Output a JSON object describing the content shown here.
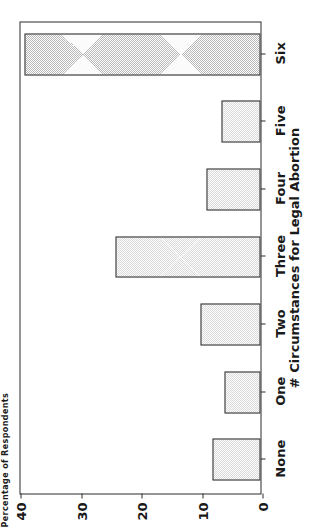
{
  "chart_data": {
    "type": "bar",
    "title": "",
    "xlabel": "# Circumstances for Legal Abortion",
    "ylabel": "Percentage of Respondents",
    "categories": [
      "None",
      "One",
      "Two",
      "Three",
      "Four",
      "Five",
      "Six"
    ],
    "values": [
      8,
      6,
      10,
      24,
      9,
      6.5,
      39
    ],
    "ylim": [
      0,
      40
    ],
    "yticks": [
      0,
      10,
      20,
      30,
      40
    ],
    "ytick_labels": [
      "0",
      "10",
      "20",
      "30",
      "40"
    ],
    "grid": false,
    "legend": null,
    "orientation": "rotated-90ccw",
    "bar_fill": "#b9b9b9",
    "bar_edge": "#3a3a3a",
    "axis_color": "#2b2b2b",
    "background": "#ffffff"
  }
}
